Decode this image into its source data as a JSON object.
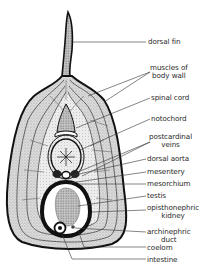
{
  "diagram": {
    "type": "cross-section",
    "colors": {
      "ink": "#111111",
      "fill_light": "#e6e6e6",
      "fill_mid": "#cfcfcf",
      "fill_dark": "#9a9a9a",
      "label": "#2a2a2a"
    },
    "labels": [
      {
        "id": "dorsal-fin",
        "lines": [
          "dorsal fin"
        ]
      },
      {
        "id": "muscles-of-body-wall",
        "lines": [
          "muscles of",
          "body wall"
        ]
      },
      {
        "id": "spinal-cord",
        "lines": [
          "spinal cord"
        ]
      },
      {
        "id": "notochord",
        "lines": [
          "notochord"
        ]
      },
      {
        "id": "postcardinal-veins",
        "lines": [
          "postcardinal",
          "veins"
        ]
      },
      {
        "id": "dorsal-aorta",
        "lines": [
          "dorsal aorta"
        ]
      },
      {
        "id": "mesentery",
        "lines": [
          "mesentery"
        ]
      },
      {
        "id": "mesorchium",
        "lines": [
          "mesorchium"
        ]
      },
      {
        "id": "testis",
        "lines": [
          "testis"
        ]
      },
      {
        "id": "opisthonephric-kidney",
        "lines": [
          "opisthonephric",
          "kidney"
        ]
      },
      {
        "id": "archinephric-duct",
        "lines": [
          "archinephric",
          "duct"
        ]
      },
      {
        "id": "coelom",
        "lines": [
          "coelom"
        ]
      },
      {
        "id": "intestine",
        "lines": [
          "intestine"
        ]
      }
    ]
  }
}
